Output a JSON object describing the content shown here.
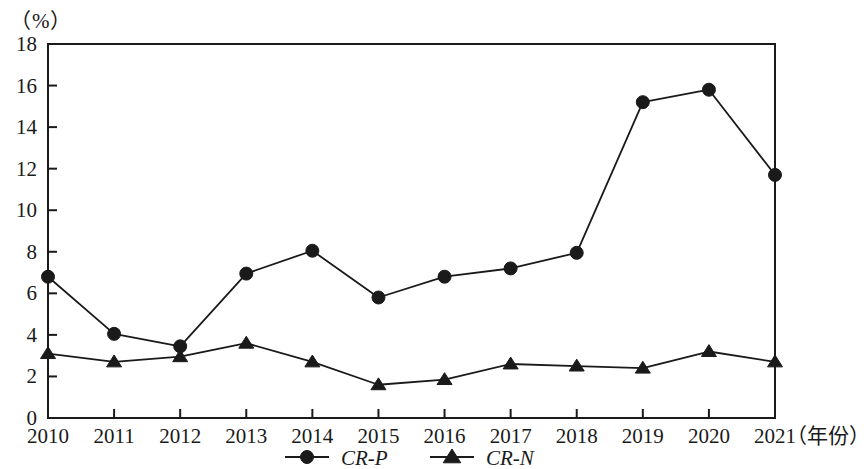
{
  "chart_data": {
    "type": "line",
    "title": "",
    "subtitle": "",
    "unit_label": "（%）",
    "xlabel": "（年份）",
    "ylabel": "",
    "categories": [
      "2010",
      "2011",
      "2012",
      "2013",
      "2014",
      "2015",
      "2016",
      "2017",
      "2018",
      "2019",
      "2020",
      "2021"
    ],
    "x_tick_labels": [
      "2010",
      "2011",
      "2012",
      "2013",
      "2014",
      "2015",
      "2016",
      "2017",
      "2018",
      "2019",
      "2020",
      "2021"
    ],
    "y_tick_labels": [
      "0",
      "2",
      "4",
      "6",
      "8",
      "10",
      "12",
      "14",
      "16",
      "18"
    ],
    "y_ticks": [
      0,
      2,
      4,
      6,
      8,
      10,
      12,
      14,
      16,
      18
    ],
    "ylim": [
      0,
      18
    ],
    "grid": false,
    "legend_position": "bottom-center",
    "series": [
      {
        "name": "CR-P",
        "marker": "circle",
        "color": "#1a1a1a",
        "values": [
          6.8,
          4.05,
          3.45,
          6.95,
          8.05,
          5.8,
          6.8,
          7.2,
          7.95,
          15.2,
          15.8,
          11.7
        ]
      },
      {
        "name": "CR-N",
        "marker": "triangle",
        "color": "#1a1a1a",
        "values": [
          3.1,
          2.7,
          2.95,
          3.6,
          2.7,
          1.6,
          1.85,
          2.6,
          2.5,
          2.4,
          3.2,
          2.7
        ]
      }
    ]
  },
  "legend": {
    "items": [
      {
        "label": "CR-P",
        "marker": "circle"
      },
      {
        "label": "CR-N",
        "marker": "triangle"
      }
    ]
  }
}
